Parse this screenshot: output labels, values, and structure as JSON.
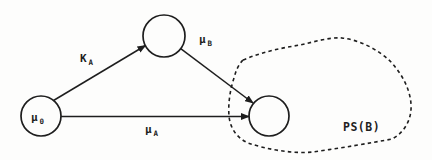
{
  "figure": {
    "nodes": {
      "start": {
        "label_main": "μ",
        "label_sub": "0"
      },
      "intermediate": {
        "label_main": "",
        "label_sub": ""
      },
      "target": {
        "label_main": "",
        "label_sub": ""
      }
    },
    "edges": {
      "ka": {
        "label_main": "K",
        "label_sub": "A"
      },
      "mu_b": {
        "label_main": "μ",
        "label_sub": "B"
      },
      "mu_a": {
        "label_main": "μ",
        "label_sub": "A"
      }
    },
    "region": {
      "label": "PS(B)"
    },
    "colors": {
      "ink": "#1e1e1e",
      "background": "#fdfdfc"
    }
  }
}
